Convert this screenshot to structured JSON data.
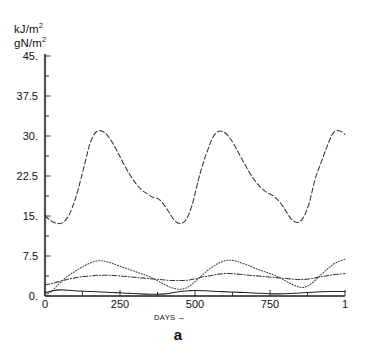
{
  "figure": {
    "panel_label": "a",
    "axis_units_line1": "kJ/m",
    "axis_units_line1_sup": "2",
    "axis_units_line2": "gN/m",
    "axis_units_line2_sup": "2",
    "x_axis_caption": "DAYS",
    "x_axis_arrow": "→"
  },
  "chart_data": {
    "type": "line",
    "title": "",
    "subtitle": "",
    "panel": "a",
    "xlabel": "DAYS",
    "ylabel": "kJ/m2 gN/m2",
    "xlim": [
      0,
      1000
    ],
    "ylim": [
      0,
      45
    ],
    "grid": false,
    "legend": "none",
    "x_ticks": [
      0,
      250,
      500,
      750,
      1000
    ],
    "x_tick_labels": [
      "0",
      "250",
      "500",
      "750",
      "1"
    ],
    "x_minor_ticks": [
      125,
      375,
      625,
      875
    ],
    "y_ticks": [
      0,
      7.5,
      15,
      22.5,
      30,
      37.5,
      45
    ],
    "y_tick_labels": [
      "0.",
      "7.5",
      "15.",
      "22.5",
      "30.",
      "37.5",
      "45."
    ],
    "y_minor_ticks": [
      3.75,
      11.25,
      18.75,
      26.25,
      33.75,
      41.25
    ],
    "series": [
      {
        "name": "series-1-dashed-upper",
        "style": "dashed",
        "color": "#333333",
        "x": [
          0,
          20,
          40,
          60,
          80,
          100,
          120,
          140,
          150,
          165,
          180,
          200,
          220,
          240,
          260,
          280,
          300,
          320,
          340,
          360,
          375,
          390,
          410,
          430,
          450,
          470,
          490,
          510,
          525,
          540,
          560,
          580,
          600,
          620,
          640,
          660,
          680,
          700,
          720,
          740,
          760,
          780,
          800,
          820,
          840,
          860,
          880,
          900,
          920,
          940,
          960,
          980,
          1000
        ],
        "y": [
          15.0,
          14.1,
          13.6,
          13.8,
          15.2,
          18.0,
          22.0,
          26.5,
          28.6,
          30.4,
          31.0,
          30.6,
          29.2,
          27.2,
          25.0,
          23.0,
          21.3,
          20.0,
          19.2,
          18.5,
          18.3,
          17.6,
          16.0,
          14.3,
          13.6,
          14.3,
          17.0,
          21.5,
          24.5,
          27.0,
          29.8,
          30.9,
          30.6,
          29.3,
          27.4,
          25.3,
          23.3,
          21.6,
          20.3,
          19.4,
          18.8,
          17.8,
          16.2,
          14.5,
          13.8,
          14.6,
          17.3,
          21.8,
          25.0,
          28.0,
          30.5,
          31.0,
          30.3
        ]
      },
      {
        "name": "series-2-dotted",
        "style": "dotted",
        "color": "#444444",
        "x": [
          0,
          20,
          40,
          60,
          80,
          100,
          120,
          140,
          160,
          180,
          200,
          220,
          240,
          260,
          280,
          300,
          320,
          340,
          360,
          380,
          400,
          420,
          440,
          460,
          480,
          500,
          520,
          540,
          560,
          580,
          600,
          620,
          640,
          660,
          680,
          700,
          720,
          740,
          760,
          780,
          800,
          820,
          840,
          860,
          880,
          900,
          920,
          940,
          960,
          980,
          1000
        ],
        "y": [
          0.2,
          0.8,
          1.9,
          3.0,
          3.9,
          4.6,
          5.3,
          5.9,
          6.4,
          6.6,
          6.5,
          6.2,
          5.8,
          5.4,
          5.0,
          4.6,
          4.2,
          3.8,
          3.3,
          2.7,
          2.1,
          1.6,
          1.3,
          1.3,
          1.8,
          2.7,
          3.7,
          4.7,
          5.5,
          6.2,
          6.6,
          6.7,
          6.5,
          6.1,
          5.7,
          5.2,
          4.8,
          4.4,
          4.0,
          3.5,
          2.9,
          2.3,
          1.8,
          1.6,
          2.0,
          2.9,
          4.0,
          5.0,
          5.9,
          6.5,
          6.9
        ]
      },
      {
        "name": "series-3-dash-dot",
        "style": "dash-dot",
        "color": "#3a3a3a",
        "x": [
          0,
          20,
          40,
          60,
          80,
          100,
          120,
          140,
          160,
          180,
          200,
          220,
          240,
          260,
          280,
          300,
          320,
          340,
          360,
          380,
          400,
          420,
          440,
          460,
          480,
          500,
          520,
          540,
          560,
          580,
          600,
          620,
          640,
          660,
          680,
          700,
          720,
          740,
          760,
          780,
          800,
          820,
          840,
          860,
          880,
          900,
          920,
          940,
          960,
          980,
          1000
        ],
        "y": [
          2.1,
          2.3,
          2.6,
          2.9,
          3.2,
          3.4,
          3.6,
          3.7,
          3.8,
          3.9,
          3.9,
          3.9,
          3.8,
          3.7,
          3.6,
          3.5,
          3.4,
          3.3,
          3.2,
          3.1,
          3.0,
          2.9,
          2.9,
          2.9,
          3.0,
          3.2,
          3.5,
          3.7,
          3.9,
          4.1,
          4.2,
          4.2,
          4.1,
          4.0,
          3.9,
          3.8,
          3.7,
          3.6,
          3.5,
          3.4,
          3.3,
          3.2,
          3.1,
          3.1,
          3.2,
          3.4,
          3.6,
          3.8,
          4.0,
          4.1,
          4.2
        ]
      },
      {
        "name": "series-4-solid-baseline",
        "style": "solid",
        "color": "#222222",
        "x": [
          0,
          15,
          30,
          50,
          70,
          90,
          110,
          130,
          150,
          170,
          190,
          210,
          230,
          250,
          280,
          310,
          340,
          370,
          400,
          420,
          440,
          460,
          480,
          500,
          530,
          560,
          590,
          620,
          650,
          680,
          710,
          740,
          770,
          800,
          830,
          860,
          890,
          920,
          950,
          980,
          1000
        ],
        "y": [
          0.55,
          0.85,
          1.05,
          1.15,
          1.1,
          1.05,
          0.95,
          0.9,
          0.85,
          0.8,
          0.75,
          0.7,
          0.65,
          0.6,
          0.5,
          0.42,
          0.35,
          0.32,
          0.4,
          0.55,
          0.75,
          0.9,
          1.0,
          1.05,
          1.0,
          0.9,
          0.82,
          0.75,
          0.68,
          0.6,
          0.52,
          0.45,
          0.4,
          0.42,
          0.5,
          0.62,
          0.72,
          0.8,
          0.85,
          0.85,
          0.82
        ]
      }
    ]
  }
}
